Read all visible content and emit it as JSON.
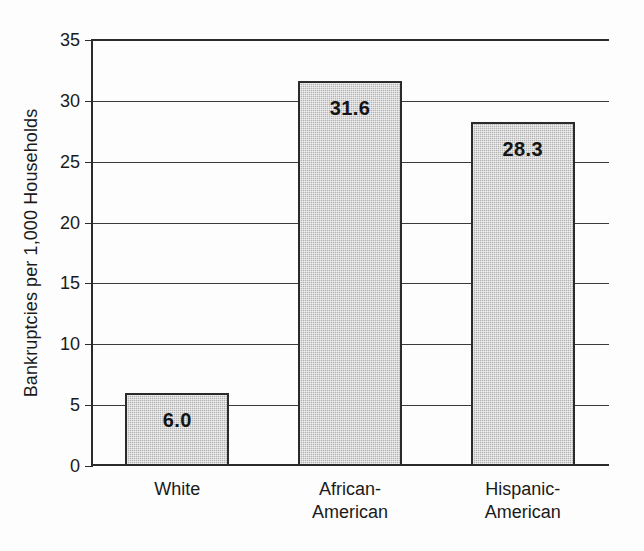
{
  "chart_data": {
    "type": "bar",
    "title": "",
    "xlabel": "",
    "ylabel": "Bankruptcies per 1,000 Households",
    "categories": [
      "White",
      "African-\nAmerican",
      "Hispanic-\nAmerican"
    ],
    "values": [
      6.0,
      31.6,
      28.3
    ],
    "value_labels": [
      "6.0",
      "31.6",
      "28.3"
    ],
    "ylim": [
      0,
      35
    ],
    "ytick_labels": [
      "0",
      "5",
      "10",
      "15",
      "20",
      "25",
      "30",
      "35"
    ],
    "ytick_values": [
      0,
      5,
      10,
      15,
      20,
      25,
      30,
      35
    ],
    "grid": true,
    "grid_axis": "y",
    "legend": "none",
    "bar_fill_color": "#b3b3b3",
    "bar_edge_color": "#2b2b2b",
    "axis_color": "#2b2b2b",
    "text_color": "#1a1a1a",
    "background_color": "#fdfdfd"
  }
}
